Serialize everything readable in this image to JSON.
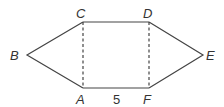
{
  "diagram": {
    "type": "geometry-figure",
    "vertices": {
      "A": {
        "label": "A",
        "x": 83,
        "y": 88
      },
      "B": {
        "label": "B",
        "x": 27,
        "y": 55
      },
      "C": {
        "label": "C",
        "x": 83,
        "y": 22
      },
      "D": {
        "label": "D",
        "x": 149,
        "y": 22
      },
      "E": {
        "label": "E",
        "x": 203,
        "y": 55
      },
      "F": {
        "label": "F",
        "x": 149,
        "y": 88
      }
    },
    "solid_edges": [
      "A-B",
      "B-C",
      "C-D",
      "D-E",
      "E-F",
      "F-A"
    ],
    "dashed_edges": [
      "C-A",
      "D-F"
    ],
    "measurements": [
      {
        "segment": "A-F",
        "label": "5"
      }
    ],
    "colors": {
      "stroke": "#444444",
      "text": "#333333"
    }
  }
}
